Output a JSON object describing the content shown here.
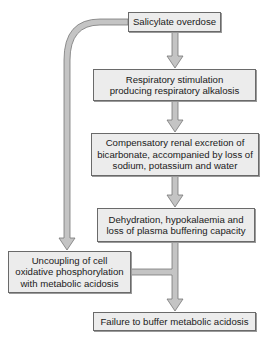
{
  "diagram": {
    "type": "flowchart",
    "nodes": [
      {
        "id": "n1",
        "label": "Salicylate overdose"
      },
      {
        "id": "n2",
        "label": "Respiratory stimulation producing respiratory alkalosis"
      },
      {
        "id": "n3",
        "label": "Compensatory renal excretion of bicarbonate, accompanied by loss of sodium, potassium and water"
      },
      {
        "id": "n4",
        "label": "Dehydration, hypokalaemia and loss of plasma buffering capacity"
      },
      {
        "id": "n5",
        "label": "Uncoupling of cell oxidative phosphorylation with metabolic acidosis"
      },
      {
        "id": "n6",
        "label": "Failure to buffer metabolic acidosis"
      }
    ],
    "edges": [
      {
        "from": "n1",
        "to": "n2"
      },
      {
        "from": "n2",
        "to": "n3"
      },
      {
        "from": "n3",
        "to": "n4"
      },
      {
        "from": "n1",
        "to": "n5"
      },
      {
        "from": "n4",
        "to": "n6"
      },
      {
        "from": "n5",
        "to": "n6"
      }
    ],
    "colors": {
      "box_fill": "#ececec",
      "box_border": "#6a6a6a",
      "arrow_fill": "#c4c4c4",
      "arrow_stroke": "#777777"
    }
  },
  "boxes": {
    "b1": "Salicylate overdose",
    "b2": "Respiratory stimulation producing respiratory alkalosis",
    "b3": "Compensatory renal excretion of bicarbonate, accompanied by loss of sodium, potassium and water",
    "b4": "Dehydration, hypokalaemia and loss of plasma buffering capacity",
    "b5": "Uncoupling of cell oxidative phosphorylation with metabolic acidosis",
    "b6": "Failure to buffer metabolic acidosis"
  }
}
